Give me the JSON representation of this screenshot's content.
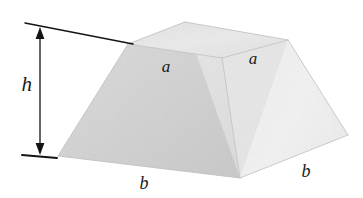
{
  "figure": {
    "name": "truncated-square-pyramid-frustum",
    "caption": "",
    "background_color": "#ffffff",
    "labels": {
      "height": "h",
      "top_edge_left": "a",
      "top_edge_right": "a",
      "bottom_edge_left": "b",
      "bottom_edge_right": "b"
    },
    "colors": {
      "ink": "#1a1a1a",
      "face_top": "#e9e9e9",
      "face_left_back": "#dcdcdc",
      "face_left_front": "#d2d2d2",
      "face_front_center": "#e6e6e6",
      "face_right": "#f1f1f1",
      "edge_soft": "#c8c8c8"
    },
    "annotations": {
      "height_arrow": "double-headed-vertical-arrow",
      "top_extension_line": "sloped-leader-line",
      "bottom_extension_line": "short-tick-line"
    },
    "geometry": {
      "top_face": "185,22 288,40 222,58 128,44",
      "bottom_base": "58,156 240,178 348,135",
      "description": "Frustum of a square pyramid with top side a and base side b, vertical height h"
    }
  }
}
